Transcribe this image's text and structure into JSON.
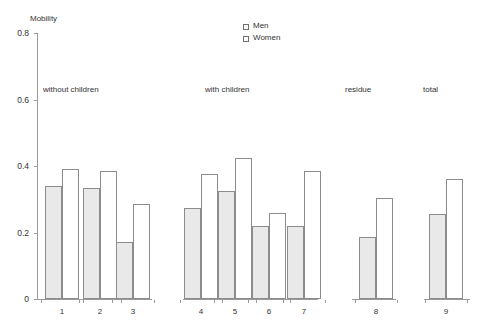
{
  "chart_data": {
    "type": "bar",
    "title": "",
    "ylabel": "Mobility",
    "xlabel": "",
    "ylim": [
      0,
      0.8
    ],
    "ytick_labels": [
      "0",
      "0.2",
      "0.4",
      "0.6",
      "0.8"
    ],
    "ytick_values": [
      0,
      0.2,
      0.4,
      0.6,
      0.8
    ],
    "grid": false,
    "legend_position": "top-center",
    "categories": [
      "1",
      "2",
      "3",
      "4",
      "5",
      "6",
      "7",
      "8",
      "9"
    ],
    "series": [
      {
        "name": "Men",
        "color": "#e9e9e9",
        "values": [
          0.34,
          0.335,
          0.17,
          0.275,
          0.325,
          0.22,
          0.22,
          0.185,
          0.255
        ]
      },
      {
        "name": "Women",
        "color": "#ffffff",
        "values": [
          0.39,
          0.385,
          0.285,
          0.375,
          0.425,
          0.26,
          0.385,
          0.305,
          0.36
        ]
      }
    ],
    "group_labels": [
      {
        "text": "without children",
        "x": 43
      },
      {
        "text": "with children",
        "x": 205
      },
      {
        "text": "residue",
        "x": 345
      },
      {
        "text": "total",
        "x": 423
      }
    ],
    "annotations": []
  }
}
